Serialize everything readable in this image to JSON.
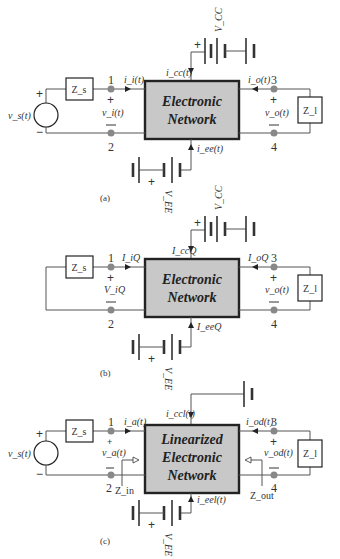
{
  "figures": [
    {
      "id": "a",
      "caption": "(a)",
      "box_lines": [
        "Electronic",
        "Network"
      ],
      "source": {
        "label": "v_s(t)",
        "plus": "+",
        "minus": "−"
      },
      "zs": "Z_s",
      "zl": "Z_l",
      "port_in": {
        "top": "1",
        "bottom": "2",
        "current": "i_i(t)",
        "voltage": "v_i(t)",
        "plus": "+",
        "minus": "−"
      },
      "port_out": {
        "top": "3",
        "bottom": "4",
        "current": "i_o(t)",
        "voltage": "v_o(t)",
        "plus": "+",
        "minus": "−"
      },
      "top_supply": {
        "label": "V_CC",
        "current": "i_cc(t)",
        "plus": "+"
      },
      "bottom_supply": {
        "label": "V_EE",
        "current": "i_ee(t)",
        "plus": "+"
      }
    },
    {
      "id": "b",
      "caption": "(b)",
      "box_lines": [
        "Electronic",
        "Network"
      ],
      "zs": "Z_s",
      "zl": "Z_l",
      "port_in": {
        "top": "1",
        "bottom": "2",
        "current": "I_iQ",
        "voltage": "V_iQ",
        "plus": "+",
        "minus": "−"
      },
      "port_out": {
        "top": "3",
        "bottom": "4",
        "current": "I_oQ",
        "voltage": "v_o(t)",
        "plus": "+",
        "minus": "−"
      },
      "top_supply": {
        "label": "V_CC",
        "current": "I_ccQ",
        "plus": "+"
      },
      "bottom_supply": {
        "label": "V_EE",
        "current": "I_eeQ",
        "plus": "+"
      }
    },
    {
      "id": "c",
      "caption": "(c)",
      "box_lines": [
        "Linearized",
        "Electronic",
        "Network"
      ],
      "source": {
        "label": "v_s(t)",
        "plus": "+",
        "minus": "−"
      },
      "zs": "Z_s",
      "zl": "Z_l",
      "port_in": {
        "top": "1",
        "bottom": "2",
        "current": "i_a(t)",
        "voltage": "v_a(t)",
        "plus": "+",
        "minus": "−",
        "impedance": "Z_in"
      },
      "port_out": {
        "top": "3",
        "bottom": "4",
        "current": "i_od(t)",
        "voltage": "v_od(t)",
        "plus": "+",
        "minus": "−",
        "impedance": "Z_out"
      },
      "top_supply": {
        "current": "i_ccl(t)"
      },
      "bottom_supply": {
        "label": "V_EE",
        "current": "i_eel(t)",
        "plus": "+"
      }
    }
  ],
  "colors": {
    "box_fill": "#c8c8c8",
    "wire": "#555555",
    "node": "#888888",
    "text": "#333333"
  }
}
